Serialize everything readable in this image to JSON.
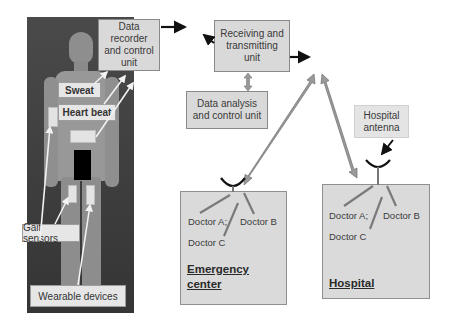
{
  "diagram": {
    "type": "wearable health monitoring system",
    "body_sensors": {
      "sweat": "Sweat",
      "heart_beat": "Heart beat",
      "gait_sensors": "Gait sensors",
      "wearable_devices": "Wearable devices"
    },
    "units": {
      "data_recorder": "Data recorder and control unit",
      "receiving_transmitting": "Receiving and transmitting unit",
      "data_analysis": "Data analysis and control unit"
    },
    "hospital_antenna": "Hospital antenna",
    "emergency_center": {
      "title_line1": "Emergency",
      "title_line2": "center",
      "doctor_a": "Doctor A;",
      "doctor_b": "Doctor B",
      "doctor_c": "Doctor C"
    },
    "hospital": {
      "title": "Hospital",
      "doctor_a": "Doctor A;",
      "doctor_b": "Doctor B",
      "doctor_c": "Doctor C"
    },
    "colors": {
      "box_fill": "#d9d9d9",
      "arrow_gray": "#8c8c8c",
      "arrow_black": "#111111",
      "photo_bg": "#404040"
    }
  }
}
